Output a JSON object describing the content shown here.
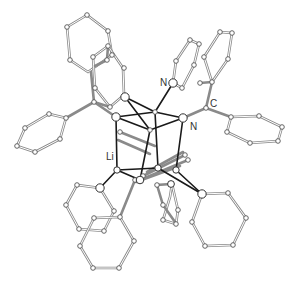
{
  "figure": {
    "type": "crystal-structure",
    "labels": [
      {
        "id": "label-n-pyridyl",
        "text": "N",
        "x": 160,
        "y": 86
      },
      {
        "id": "label-n-amidinate",
        "text": "N",
        "x": 190,
        "y": 130
      },
      {
        "id": "label-c",
        "text": "C",
        "x": 210,
        "y": 107
      },
      {
        "id": "label-li",
        "text": "Li",
        "x": 108,
        "y": 160
      }
    ],
    "colors": {
      "ring_bond": "#8a8a8a",
      "core_bond": "#1a1a1a",
      "atom_fill": "#ffffff",
      "background": "#ffffff"
    }
  }
}
